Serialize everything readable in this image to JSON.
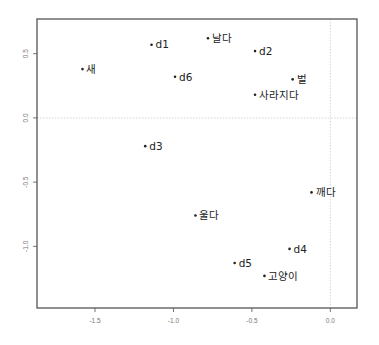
{
  "chart_data": {
    "type": "scatter",
    "title": "",
    "xlabel": "",
    "ylabel": "",
    "xlim": [
      -1.87,
      0.17
    ],
    "ylim": [
      -1.48,
      0.77
    ],
    "grid": false,
    "reference_lines": {
      "x": 0.0,
      "y": 0.0,
      "style": "dotted"
    },
    "x_ticks": [
      -1.5,
      -1.0,
      -0.5,
      0.0
    ],
    "x_tick_labels": [
      "-1.5",
      "-1.0",
      "-0.5",
      "0.0"
    ],
    "y_ticks": [
      0.5,
      0.0,
      -0.5,
      -1.0
    ],
    "y_tick_labels": [
      "0.5",
      "0.0",
      "-0.5",
      "-1.0"
    ],
    "points": [
      {
        "label": "d1",
        "x": -1.14,
        "y": 0.57
      },
      {
        "label": "새",
        "x": -1.58,
        "y": 0.38
      },
      {
        "label": "d6",
        "x": -0.99,
        "y": 0.32
      },
      {
        "label": "날다",
        "x": -0.78,
        "y": 0.62
      },
      {
        "label": "d2",
        "x": -0.48,
        "y": 0.52
      },
      {
        "label": "벌",
        "x": -0.24,
        "y": 0.3
      },
      {
        "label": "사라지다",
        "x": -0.48,
        "y": 0.18
      },
      {
        "label": "d3",
        "x": -1.18,
        "y": -0.22
      },
      {
        "label": "울다",
        "x": -0.86,
        "y": -0.76
      },
      {
        "label": "깨다",
        "x": -0.12,
        "y": -0.58
      },
      {
        "label": "d4",
        "x": -0.26,
        "y": -1.02
      },
      {
        "label": "d5",
        "x": -0.61,
        "y": -1.13
      },
      {
        "label": "고양이",
        "x": -0.42,
        "y": -1.23
      }
    ]
  },
  "style": {
    "axis_color": "#555555",
    "ref_line_color": "#cccccc",
    "point_color": "#222222"
  }
}
